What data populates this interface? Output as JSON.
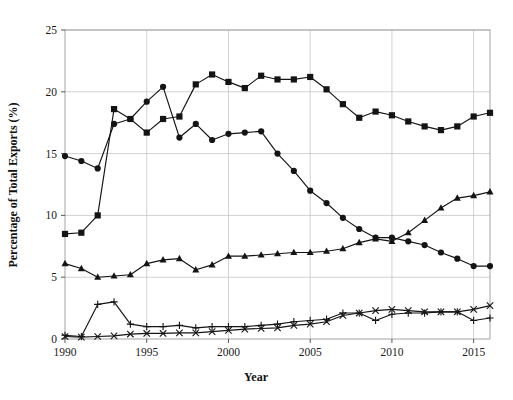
{
  "chart_data": {
    "type": "line",
    "title": "",
    "xlabel": "Year",
    "ylabel": "Percentage of Total Exports (%)",
    "xlim": [
      1990,
      2016
    ],
    "ylim": [
      0,
      25
    ],
    "xticks": [
      1990,
      1995,
      2000,
      2005,
      2010,
      2015
    ],
    "xtick_labels": [
      "1990",
      "1995",
      "2000",
      "2005",
      "2010",
      "2015"
    ],
    "yticks": [
      0,
      5,
      10,
      15,
      20,
      25
    ],
    "ytick_labels": [
      "0",
      "5",
      "10",
      "15",
      "20",
      "25"
    ],
    "grid": true,
    "legend": "none",
    "x": [
      1990,
      1991,
      1992,
      1993,
      1994,
      1995,
      1996,
      1997,
      1998,
      1999,
      2000,
      2001,
      2002,
      2003,
      2004,
      2005,
      2006,
      2007,
      2008,
      2009,
      2010,
      2011,
      2012,
      2013,
      2014,
      2015,
      2016
    ],
    "series": [
      {
        "name": "Series 1",
        "marker": "circle",
        "values": [
          14.8,
          14.4,
          13.8,
          17.4,
          17.8,
          19.2,
          20.4,
          16.3,
          17.4,
          16.1,
          16.6,
          16.7,
          16.8,
          15.0,
          13.6,
          12.0,
          11.0,
          9.8,
          8.9,
          8.2,
          8.2,
          7.9,
          7.6,
          7.0,
          6.5,
          5.9,
          5.9
        ]
      },
      {
        "name": "Series 2",
        "marker": "square",
        "values": [
          8.5,
          8.6,
          10.0,
          18.6,
          17.8,
          16.7,
          17.8,
          18.0,
          20.6,
          21.4,
          20.8,
          20.3,
          21.3,
          21.0,
          21.0,
          21.2,
          20.2,
          19.0,
          17.9,
          18.4,
          18.1,
          17.6,
          17.2,
          16.9,
          17.2,
          18.0,
          18.3
        ]
      },
      {
        "name": "Series 3",
        "marker": "triangle",
        "values": [
          6.1,
          5.7,
          5.0,
          5.1,
          5.2,
          6.1,
          6.4,
          6.5,
          5.6,
          6.0,
          6.7,
          6.7,
          6.8,
          6.9,
          7.0,
          7.0,
          7.1,
          7.3,
          7.8,
          8.1,
          7.9,
          8.6,
          9.6,
          10.6,
          11.4,
          11.6,
          11.9
        ]
      },
      {
        "name": "Series 4",
        "marker": "plus",
        "values": [
          0.3,
          0.2,
          2.8,
          3.0,
          1.2,
          1.0,
          1.0,
          1.1,
          0.9,
          1.0,
          1.0,
          1.0,
          1.1,
          1.2,
          1.4,
          1.5,
          1.6,
          2.1,
          2.1,
          1.5,
          2.0,
          2.1,
          2.1,
          2.2,
          2.2,
          1.5,
          1.7
        ]
      },
      {
        "name": "Series 5",
        "marker": "cross",
        "values": [
          0.2,
          0.15,
          0.2,
          0.25,
          0.4,
          0.45,
          0.45,
          0.5,
          0.5,
          0.6,
          0.7,
          0.8,
          0.85,
          0.9,
          1.1,
          1.2,
          1.4,
          1.9,
          2.1,
          2.3,
          2.4,
          2.3,
          2.2,
          2.2,
          2.2,
          2.4,
          2.7
        ]
      }
    ]
  },
  "colors": {
    "ink": "#141414",
    "grid": "#bfbfbf",
    "frame": "#9a9a9a",
    "background": "#ffffff"
  }
}
